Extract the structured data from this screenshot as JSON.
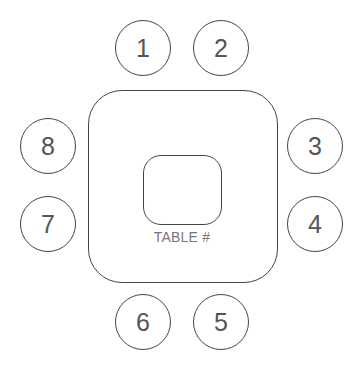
{
  "table": {
    "label": "TABLE #"
  },
  "seats": [
    {
      "number": "1",
      "side": "top"
    },
    {
      "number": "2",
      "side": "top"
    },
    {
      "number": "3",
      "side": "right"
    },
    {
      "number": "4",
      "side": "right"
    },
    {
      "number": "5",
      "side": "bottom"
    },
    {
      "number": "6",
      "side": "bottom"
    },
    {
      "number": "7",
      "side": "left"
    },
    {
      "number": "8",
      "side": "left"
    }
  ]
}
